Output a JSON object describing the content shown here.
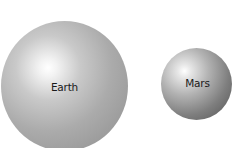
{
  "planets": [
    {
      "name": "Earth",
      "color": "#a8a8a8"
    },
    {
      "name": "Mars",
      "color": "#7a7a7a"
    }
  ]
}
